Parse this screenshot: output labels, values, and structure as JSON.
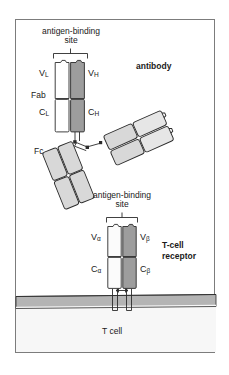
{
  "figure": {
    "title_visible": false,
    "background": "#ffffff",
    "frame_border_color": "#7c7c7c"
  },
  "labels": {
    "antibody": "antibody",
    "tcell_receptor_line1": "T-cell",
    "tcell_receptor_line2": "receptor",
    "antigen_binding_top_line1": "antigen-binding",
    "antigen_binding_top_line2": "site",
    "antigen_binding_tcr_line1": "antigen-binding",
    "antigen_binding_tcr_line2": "site",
    "fab": "Fab",
    "fc": "Fc",
    "tcell": "T cell",
    "v_l": "V",
    "v_l_sub": "L",
    "v_h": "V",
    "v_h_sub": "H",
    "c_l": "C",
    "c_l_sub": "L",
    "c_h": "C",
    "c_h_sub": "H",
    "v_alpha": "V",
    "v_alpha_sub": "α",
    "v_beta": "V",
    "v_beta_sub": "β",
    "c_alpha": "C",
    "c_alpha_sub": "α",
    "c_beta": "C",
    "c_beta_sub": "β"
  },
  "colors": {
    "light_chain_fill": "#ffffff",
    "heavy_chain_fill": "#9d9d9d",
    "fc_domain_fill": "#d8d8d8",
    "tcr_alpha_fill": "#fbfbfb",
    "tcr_beta_fill": "#9d9d9d",
    "membrane_fill": "#b4b4b4",
    "cell_fill": "#f7f7f7",
    "outline": "#2b2b2b",
    "text": "#1a1a1a"
  },
  "structures": {
    "antibody": {
      "name": "antibody",
      "parts": [
        "Fab",
        "Fab",
        "Fc"
      ],
      "chains": [
        "light chain",
        "heavy chain"
      ],
      "domains_left_fab": [
        "V_L",
        "V_H",
        "C_L",
        "C_H"
      ],
      "antigen_binding_sites": 2,
      "hinge_disulfides": 2
    },
    "tcell_receptor": {
      "name": "T-cell receptor",
      "chains": [
        "alpha chain",
        "beta chain"
      ],
      "domains": [
        "V_alpha",
        "V_beta",
        "C_alpha",
        "C_beta"
      ],
      "antigen_binding_sites": 1,
      "membrane_anchored": true
    },
    "membrane": {
      "label": "T cell",
      "transmembrane_segments": 2
    }
  }
}
